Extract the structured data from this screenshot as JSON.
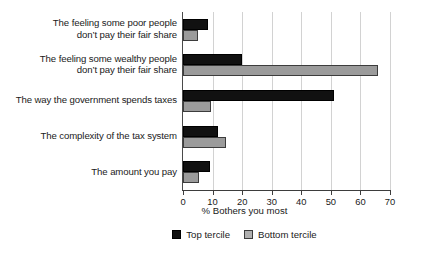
{
  "chart_data": {
    "type": "bar",
    "orientation": "horizontal",
    "title": "",
    "xlabel": "% Bothers you most",
    "ylabel": "",
    "xlim": [
      0,
      70
    ],
    "xticks": [
      0,
      10,
      20,
      30,
      40,
      50,
      60,
      70
    ],
    "grid": "vertical",
    "legend_position": "bottom-center",
    "categories": [
      "The feeling some poor people don’t pay their fair share",
      "The feeling some wealthy people don’t pay their fair share",
      "The way the government spends taxes",
      "The complexity of the tax system",
      "The amount you pay"
    ],
    "category_lines": [
      [
        "The feeling some poor people",
        "don’t pay their fair share"
      ],
      [
        "The feeling some wealthy people",
        "don’t pay their fair share"
      ],
      [
        "The way the government spends taxes"
      ],
      [
        "The complexity of the tax system"
      ],
      [
        "The amount you pay"
      ]
    ],
    "series": [
      {
        "name": "Top tercile",
        "color": "#111111",
        "values": [
          8.5,
          20.0,
          51.0,
          12.0,
          9.0
        ]
      },
      {
        "name": "Bottom tercile",
        "color": "#9b9b9b",
        "values": [
          5.0,
          66.0,
          9.5,
          14.5,
          5.5
        ]
      }
    ]
  },
  "legend": {
    "items": [
      {
        "label": "Top tercile",
        "color": "#111111"
      },
      {
        "label": "Bottom tercile",
        "color": "#b0b0b0"
      }
    ]
  },
  "axis": {
    "x_tick_labels": [
      "0",
      "10",
      "20",
      "30",
      "40",
      "50",
      "60",
      "70"
    ],
    "x_title": "% Bothers you most"
  }
}
